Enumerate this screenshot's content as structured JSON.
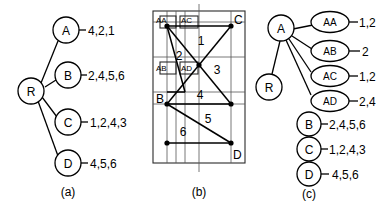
{
  "figure": {
    "panels": [
      {
        "id": "a",
        "caption": "(a)",
        "type": "tree",
        "root": "R",
        "nodes": [
          {
            "label": "A",
            "values": "4,2,1"
          },
          {
            "label": "B",
            "values": "2,4,5,6"
          },
          {
            "label": "C",
            "values": "1,2,4,3"
          },
          {
            "label": "D",
            "values": "4,5,6"
          }
        ]
      },
      {
        "id": "b",
        "caption": "(b)",
        "type": "partition-diagram",
        "corner_labels": [
          "AA",
          "C",
          "B",
          "D"
        ],
        "cell_labels": [
          "AA",
          "AC",
          "AB",
          "AD"
        ],
        "region_labels": [
          "1",
          "2",
          "3",
          "4",
          "5",
          "6"
        ]
      },
      {
        "id": "c",
        "caption": "(c)",
        "type": "tree",
        "root": "R",
        "parent": "A",
        "children": [
          {
            "label": "AA",
            "values": "1,2"
          },
          {
            "label": "AB",
            "values": "2"
          },
          {
            "label": "AC",
            "values": "1,2"
          },
          {
            "label": "AD",
            "values": "2,4"
          }
        ],
        "siblings": [
          {
            "label": "B",
            "values": "2,4,5,6"
          },
          {
            "label": "C",
            "values": "1,2,4,3"
          },
          {
            "label": "D",
            "values": "4,5,6"
          }
        ]
      }
    ]
  },
  "colors": {
    "ink": "#000000",
    "grid": "#555555",
    "background": "#ffffff"
  }
}
